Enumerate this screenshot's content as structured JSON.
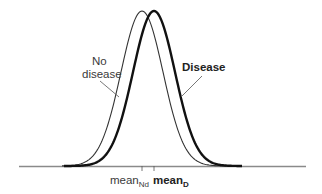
{
  "chart_data": {
    "type": "line",
    "title": "",
    "xlabel": "",
    "ylabel": "",
    "grid": false,
    "series": [
      {
        "name": "No disease",
        "distribution": "normal",
        "mean_label": "mean_Nd",
        "style": "thin"
      },
      {
        "name": "Disease",
        "distribution": "normal",
        "mean_label": "mean_D",
        "style": "bold"
      }
    ],
    "annotations": [
      "No disease",
      "Disease"
    ],
    "tick_labels": [
      "mean_Nd",
      "mean_D"
    ]
  },
  "labels": {
    "no_disease_line1": "No",
    "no_disease_line2": "disease",
    "disease": "Disease",
    "mean_nd_main": "mean",
    "mean_nd_sub": "Nd",
    "mean_d_main": "mean",
    "mean_d_sub": "D"
  },
  "colors": {
    "axis": "#888888",
    "no_disease_curve": "#333333",
    "disease_curve": "#111111",
    "text": "#3a3a3a"
  }
}
